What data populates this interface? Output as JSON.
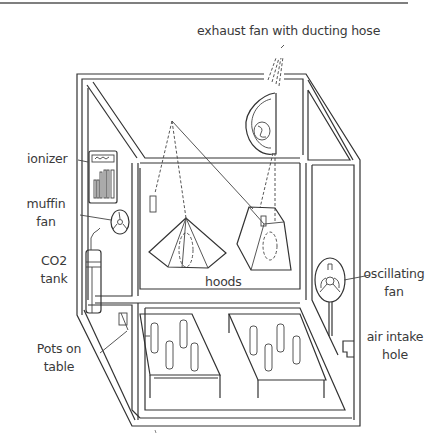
{
  "diagram": {
    "labels": {
      "exhaust_fan": "exhaust fan with ducting hose",
      "ionizer": "ionizer",
      "muffin_fan_1": "muffin",
      "muffin_fan_2": "fan",
      "co2_tank_1": "CO2",
      "co2_tank_2": "tank",
      "hoods": "hoods",
      "oscillating_fan_1": "oscillating",
      "oscillating_fan_2": "fan",
      "air_intake_1": "air intake",
      "air_intake_2": "hole",
      "pots_1": "Pots on",
      "pots_2": "table"
    },
    "components": [
      "exhaust fan with ducting hose",
      "ionizer",
      "muffin fan",
      "CO2 tank",
      "hoods",
      "oscillating fan",
      "air intake hole",
      "Pots on table"
    ],
    "colors": {
      "line": "#333333",
      "text": "#3a3a3a",
      "background": "#ffffff"
    }
  }
}
